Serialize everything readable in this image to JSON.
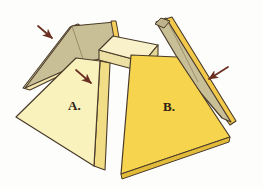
{
  "illustration": {
    "title": "Unfolded rectangular pyramid faces",
    "background_color": "#fdfdfb",
    "outline_color": "#4a3b2a",
    "labels": [
      {
        "id": "a",
        "text": "A.",
        "color": "#2e2317"
      },
      {
        "id": "b",
        "text": "B.",
        "color": "#2e2317"
      }
    ],
    "parts": [
      {
        "name": "top-slab",
        "description": "cream rectangular top face of the frustum",
        "fill": "#f7efc8",
        "side_fill": "#efe3a8"
      },
      {
        "name": "front-left-face",
        "description": "pale yellow trapezoid labelled A.",
        "fill": "#f9f2bc",
        "edge_fill": "#f2e08a"
      },
      {
        "name": "front-right-face",
        "description": "golden yellow trapezoid labelled B.",
        "fill": "#f6d44e",
        "edge_fill": "#e8bb34"
      },
      {
        "name": "back-left-face",
        "description": "shaded khaki trapezoid behind on the left",
        "fill": "#c9bf97",
        "edge_fill": "#f3e7ae"
      },
      {
        "name": "back-right-face",
        "description": "shaded khaki trapezoid behind on the right",
        "fill": "#c9bf97",
        "edge_fill": "#f2c94a"
      }
    ],
    "arrows": [
      {
        "id": "arrow-1",
        "points_at": "back-left-face",
        "direction": "down-right",
        "color": "#6b2f22"
      },
      {
        "id": "arrow-2",
        "points_at": "front-left-face",
        "direction": "down-right",
        "color": "#6b2f22"
      },
      {
        "id": "arrow-3",
        "points_at": "back-right-face",
        "direction": "down-left",
        "color": "#6b2f22"
      }
    ]
  }
}
